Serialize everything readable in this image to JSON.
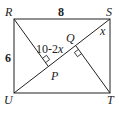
{
  "figure": {
    "type": "geometry",
    "vertices": {
      "R": "R",
      "S": "S",
      "T": "T",
      "U": "U",
      "P": "P",
      "Q": "Q"
    },
    "measures": {
      "RS": "8",
      "RU": "6",
      "RP_expr_prefix": "10-2",
      "RP_expr_var": "x",
      "angle_S": "x"
    },
    "colors": {
      "stroke": "#222222",
      "background": "#ffffff"
    }
  }
}
